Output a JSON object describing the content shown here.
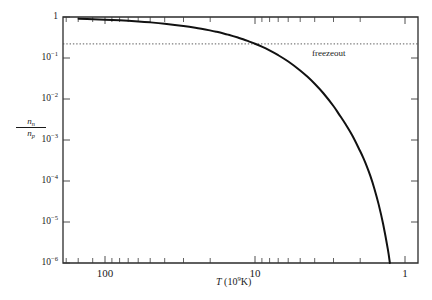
{
  "figure": {
    "ylabel_numerator": "n",
    "ylabel_numerator_sub": "n",
    "ylabel_denominator": "n",
    "ylabel_denominator_sub": "p",
    "xlabel_symbol": "T",
    "xlabel_unit_open": " (10",
    "xlabel_unit_exp": "9",
    "xlabel_unit_close": "K)",
    "annotation": "freezeout",
    "curve_color": "#111111",
    "axis_color": "#2b2b2b",
    "annotation_color": "#4a4a4a"
  },
  "axes": {
    "y_tick_labels": [
      {
        "mantissa": "1",
        "exponent": ""
      },
      {
        "mantissa": "10",
        "exponent": "−1"
      },
      {
        "mantissa": "10",
        "exponent": "−2"
      },
      {
        "mantissa": "10",
        "exponent": "−3"
      },
      {
        "mantissa": "10",
        "exponent": "−4"
      },
      {
        "mantissa": "10",
        "exponent": "−5"
      },
      {
        "mantissa": "10",
        "exponent": "−6"
      }
    ],
    "x_tick_labels": [
      "100",
      "10",
      "1"
    ]
  },
  "chart_data": {
    "type": "line",
    "title": "",
    "xlabel": "T (10^9 K)",
    "ylabel": "n_n / n_p",
    "xscale": "log",
    "yscale": "log",
    "x_reversed": true,
    "xlim": [
      200,
      0.9
    ],
    "ylim": [
      1e-06,
      1
    ],
    "x_ticks_major": [
      100,
      10,
      1
    ],
    "x_ticks_major_labels": [
      "100",
      "10",
      "1"
    ],
    "y_ticks_major": [
      1,
      0.1,
      0.01,
      0.001,
      0.0001,
      1e-05,
      1e-06
    ],
    "y_ticks_major_labels": [
      "1",
      "10^-1",
      "10^-2",
      "10^-3",
      "10^-4",
      "10^-5",
      "10^-6"
    ],
    "grid": false,
    "legend": null,
    "series": [
      {
        "name": "n_n/n_p equilibrium ratio",
        "formula": "exp(-1.5e10 K / T)",
        "x": [
          200,
          150,
          120,
          100,
          80,
          60,
          50,
          40,
          30,
          25,
          20,
          18,
          16,
          15,
          14,
          13,
          12,
          11,
          10,
          9,
          8,
          7,
          6,
          5,
          4.5,
          4,
          3.5,
          3,
          2.75,
          2.5,
          2.25,
          2,
          1.9,
          1.8,
          1.7,
          1.6,
          1.5,
          1.4,
          1.3,
          1.2,
          1.15,
          1.1,
          1.09
        ],
        "y": [
          0.928,
          0.905,
          0.882,
          0.861,
          0.829,
          0.779,
          0.741,
          0.687,
          0.607,
          0.549,
          0.472,
          0.435,
          0.392,
          0.368,
          0.342,
          0.315,
          0.287,
          0.255,
          0.223,
          0.189,
          0.153,
          0.117,
          0.0821,
          0.0498,
          0.0357,
          0.0235,
          0.0138,
          0.00674,
          0.00421,
          0.00248,
          0.0013,
          0.000553,
          0.000371,
          0.000231,
          0.000131,
          6.5e-05,
          2.73e-05,
          9.05e-06,
          2.12e-06,
          2.87e-07,
          9.11e-08,
          2.18e-08,
          1.53e-08
        ]
      }
    ],
    "annotations": [
      {
        "text": "freezeout",
        "type": "horizontal-dotted-line",
        "y_value": 0.22,
        "x_start": 200,
        "x_end": 0.9,
        "label_x": 3.6
      }
    ]
  }
}
